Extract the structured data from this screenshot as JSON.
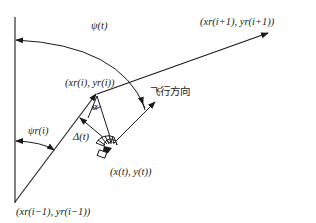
{
  "diagram": {
    "type": "path-following geometry",
    "labels": {
      "psi_t": "ψ(t)",
      "psi_r_i": "ψr(i)",
      "point_prev": "(xr(i−1), yr(i−1))",
      "point_curr": "(xr(i), yr(i))",
      "point_next": "(xr(i+1), yr(i+1))",
      "vehicle_pos": "(x(t), y(t))",
      "alpha": "α",
      "delta": "Δ(t)",
      "flight_direction": "飞行方向"
    },
    "colors": {
      "line": "#1a1a1a",
      "background": "#ffffff"
    }
  }
}
